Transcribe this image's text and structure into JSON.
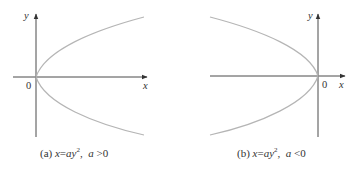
{
  "figures": [
    {
      "id": "a",
      "caption_label": "(a)",
      "equation_lhs": "x",
      "equation_eq": "=",
      "equation_rhs_a": "a",
      "equation_rhs_var": "y",
      "equation_exp": "2",
      "condition_var": "a",
      "condition_op": ">",
      "condition_val": "0",
      "axis_x_label": "x",
      "axis_y_label": "y",
      "origin_label": "0",
      "opening": "right"
    },
    {
      "id": "b",
      "caption_label": "(b)",
      "equation_lhs": "x",
      "equation_eq": "=",
      "equation_rhs_a": "a",
      "equation_rhs_var": "y",
      "equation_exp": "2",
      "condition_var": "a",
      "condition_op": "<",
      "condition_val": "0",
      "axis_x_label": "x",
      "axis_y_label": "y",
      "origin_label": "0",
      "opening": "left"
    }
  ],
  "colors": {
    "axis": "#4a4a4a",
    "curve": "#b5b5b5",
    "text": "#333333"
  }
}
